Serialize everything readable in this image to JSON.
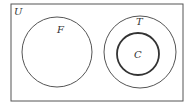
{
  "diagram": {
    "type": "venn",
    "universe": {
      "label": "U",
      "x": 11,
      "y": 4,
      "width": 172,
      "height": 97
    },
    "sets": [
      {
        "label": "F",
        "cx": 57,
        "cy": 52,
        "r": 35,
        "stroke_width": 1
      },
      {
        "label": "T",
        "cx": 140,
        "cy": 52,
        "r": 36,
        "stroke_width": 1
      },
      {
        "label": "C",
        "cx": 138,
        "cy": 54,
        "r": 21,
        "stroke_width": 1.8
      }
    ],
    "relations": [
      "C ⊂ T",
      "F ∩ T = ∅"
    ],
    "colors": {
      "stroke": "#444444",
      "background": "#ffffff"
    }
  }
}
